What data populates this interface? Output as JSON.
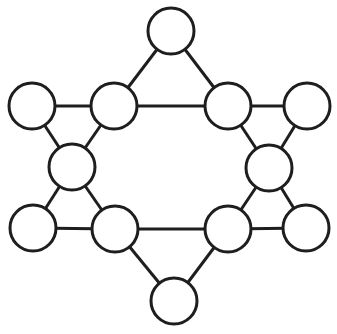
{
  "diagram": {
    "type": "graph",
    "colors": {
      "stroke": "#1e1e1e",
      "fill": "#ffffff",
      "background": "#ffffff"
    },
    "node_radius": 23,
    "nodes": [
      {
        "id": "top",
        "x": 171,
        "y": 31
      },
      {
        "id": "upper-left-outer",
        "x": 32,
        "y": 106
      },
      {
        "id": "upper-left-inner",
        "x": 114,
        "y": 106
      },
      {
        "id": "upper-right-inner",
        "x": 228,
        "y": 106
      },
      {
        "id": "upper-right-outer",
        "x": 307,
        "y": 106
      },
      {
        "id": "middle-left",
        "x": 72,
        "y": 167
      },
      {
        "id": "middle-right",
        "x": 269,
        "y": 168
      },
      {
        "id": "lower-left-outer",
        "x": 33,
        "y": 228
      },
      {
        "id": "lower-left-inner",
        "x": 115,
        "y": 229
      },
      {
        "id": "lower-right-inner",
        "x": 228,
        "y": 229
      },
      {
        "id": "lower-right-outer",
        "x": 306,
        "y": 228
      },
      {
        "id": "bottom",
        "x": 174,
        "y": 301
      }
    ],
    "edges": [
      [
        "top",
        "upper-left-inner"
      ],
      [
        "top",
        "upper-right-inner"
      ],
      [
        "upper-left-inner",
        "upper-right-inner"
      ],
      [
        "upper-left-outer",
        "upper-left-inner"
      ],
      [
        "upper-right-inner",
        "upper-right-outer"
      ],
      [
        "upper-left-outer",
        "middle-left"
      ],
      [
        "upper-left-inner",
        "middle-left"
      ],
      [
        "upper-right-inner",
        "middle-right"
      ],
      [
        "upper-right-outer",
        "middle-right"
      ],
      [
        "middle-left",
        "lower-left-outer"
      ],
      [
        "middle-left",
        "lower-left-inner"
      ],
      [
        "middle-right",
        "lower-right-inner"
      ],
      [
        "middle-right",
        "lower-right-outer"
      ],
      [
        "lower-left-outer",
        "lower-left-inner"
      ],
      [
        "lower-right-inner",
        "lower-right-outer"
      ],
      [
        "lower-left-inner",
        "lower-right-inner"
      ],
      [
        "lower-left-inner",
        "bottom"
      ],
      [
        "lower-right-inner",
        "bottom"
      ]
    ]
  }
}
